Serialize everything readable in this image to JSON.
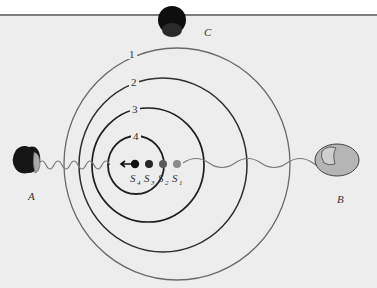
{
  "figure": {
    "observers": {
      "A": {
        "label": "A"
      },
      "B": {
        "label": "B"
      },
      "C": {
        "label": "C"
      }
    },
    "wavefronts": [
      {
        "label": "1"
      },
      {
        "label": "2"
      },
      {
        "label": "3"
      },
      {
        "label": "4"
      }
    ],
    "source_positions": [
      {
        "label": "S",
        "sub": "1"
      },
      {
        "label": "S",
        "sub": "2"
      },
      {
        "label": "S",
        "sub": "3"
      },
      {
        "label": "S",
        "sub": "4"
      }
    ],
    "colors": {
      "background": "#ededed",
      "rule": "#7d7d7d",
      "wave_line": "#7a7a7a",
      "circle_outer": "#6a6a6a",
      "circle_inner": "#1e1e1e"
    }
  }
}
